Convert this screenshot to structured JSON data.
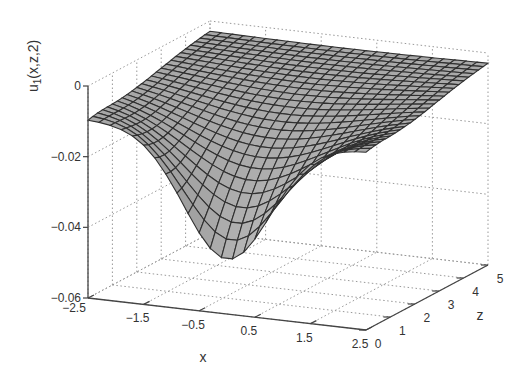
{
  "chart_data": {
    "type": "surface3d",
    "title": "",
    "xlabel": "x",
    "ylabel": "z",
    "zlabel": "u_1(x,z,2)",
    "x_ticks": [
      "-2.5",
      "-1.5",
      "-0.5",
      "0.5",
      "1.5",
      "2.5"
    ],
    "z_ticks": [
      "0",
      "1",
      "2",
      "3",
      "4",
      "5"
    ],
    "u_ticks": [
      "0",
      "-0.02",
      "-0.04",
      "-0.06"
    ],
    "xlim": [
      -2.5,
      2.5
    ],
    "zlim": [
      0,
      5
    ],
    "ulim": [
      -0.06,
      0
    ],
    "grid": true,
    "mesh": {
      "nx": 26,
      "nz": 26
    },
    "sample_values": [
      {
        "x": -2.5,
        "z": 0,
        "u": -0.01
      },
      {
        "x": 0.0,
        "z": 0,
        "u": -0.044
      },
      {
        "x": 2.5,
        "z": 0,
        "u": -0.01
      },
      {
        "x": 0.0,
        "z": 2.5,
        "u": -0.012
      },
      {
        "x": 0.0,
        "z": 5,
        "u": -0.001
      }
    ],
    "colors": {
      "face": "#a8a8a8",
      "edge": "#303030",
      "axis": "#444444",
      "grid": "#999999"
    }
  }
}
